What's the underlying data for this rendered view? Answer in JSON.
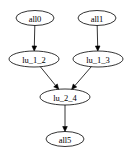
{
  "diagram": {
    "type": "directed-graph",
    "nodes": [
      {
        "id": "all0",
        "label": "all0",
        "cx": 35,
        "cy": 18,
        "rx": 19,
        "ry": 7.5
      },
      {
        "id": "all1",
        "label": "all1",
        "cx": 97,
        "cy": 18,
        "rx": 19,
        "ry": 7.5
      },
      {
        "id": "lu_1_2",
        "label": "lu_1_2",
        "cx": 34,
        "cy": 59,
        "rx": 25,
        "ry": 8
      },
      {
        "id": "lu_1_3",
        "label": "lu_1_3",
        "cx": 98,
        "cy": 59,
        "rx": 25,
        "ry": 8
      },
      {
        "id": "lu_2_4",
        "label": "lu_2_4",
        "cx": 65,
        "cy": 97,
        "rx": 25,
        "ry": 8
      },
      {
        "id": "all5",
        "label": "all5",
        "cx": 65,
        "cy": 139,
        "rx": 19,
        "ry": 7.5
      }
    ],
    "edges": [
      {
        "from": "all0",
        "to": "lu_1_2"
      },
      {
        "from": "all1",
        "to": "lu_1_3"
      },
      {
        "from": "lu_1_2",
        "to": "lu_2_4"
      },
      {
        "from": "lu_1_3",
        "to": "lu_2_4"
      },
      {
        "from": "lu_2_4",
        "to": "all5"
      }
    ],
    "colors": {
      "stroke": "#000000",
      "background": "#ffffff"
    }
  }
}
